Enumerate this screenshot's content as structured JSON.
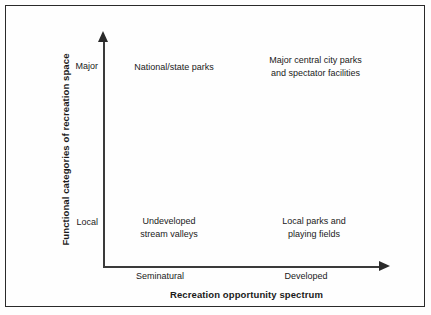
{
  "figure": {
    "background_color": "#fefefe",
    "line_color": "#2a2a2a",
    "text_color": "#1a1a1a"
  },
  "axes": {
    "x_title": "Recreation opportunity spectrum",
    "y_title": "Functional categories of recreation space",
    "x_ticks": [
      "Seminatural",
      "Developed"
    ],
    "y_ticks": [
      "Major",
      "Local"
    ]
  },
  "cells": {
    "top_left": {
      "line1": "National/state parks",
      "line2": ""
    },
    "top_right": {
      "line1": "Major central city parks",
      "line2": "and spectator facilities"
    },
    "bottom_left": {
      "line1": "Undeveloped",
      "line2": "stream valleys"
    },
    "bottom_right": {
      "line1": "Local parks and",
      "line2": "playing fields"
    }
  },
  "chart_data": {
    "type": "scatter",
    "title": "",
    "xlabel": "Recreation opportunity spectrum",
    "ylabel": "Functional categories of recreation space",
    "x_categories": [
      "Seminatural",
      "Developed"
    ],
    "y_categories": [
      "Local",
      "Major"
    ],
    "grid": false,
    "legend": "none",
    "annotations": [
      {
        "x": "Seminatural",
        "y": "Major",
        "label": "National/state parks"
      },
      {
        "x": "Developed",
        "y": "Major",
        "label": "Major central city parks and spectator facilities"
      },
      {
        "x": "Seminatural",
        "y": "Local",
        "label": "Undeveloped stream valleys"
      },
      {
        "x": "Developed",
        "y": "Local",
        "label": "Local parks and playing fields"
      }
    ]
  }
}
